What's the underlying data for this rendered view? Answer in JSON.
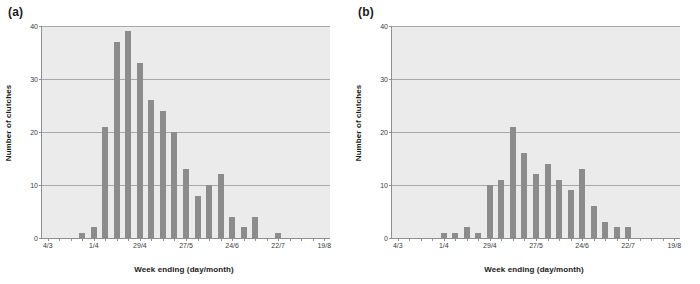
{
  "figure": {
    "background": "#ffffff",
    "bar_color": "#8c8c8c",
    "plot_background": "#ebebeb",
    "grid_color": "#a8a8a8"
  },
  "panels": [
    {
      "label": "(a)",
      "chart_data": {
        "type": "bar",
        "title": "",
        "xlabel": "Week ending (day/month)",
        "ylabel": "Number of clutches",
        "ylim": [
          0,
          40
        ],
        "yticks": [
          0,
          10,
          20,
          30,
          40
        ],
        "grid": true,
        "legend": "none",
        "x_tick_labels": [
          "4/3",
          "1/4",
          "29/4",
          "27/5",
          "24/6",
          "22/7",
          "19/8"
        ],
        "x_tick_indices": [
          0,
          4,
          8,
          12,
          16,
          20,
          24
        ],
        "n_weeks": 25,
        "categories": [
          "4/3",
          "11/3",
          "18/3",
          "25/3",
          "1/4",
          "8/4",
          "15/4",
          "22/4",
          "29/4",
          "6/5",
          "13/5",
          "20/5",
          "27/5",
          "3/6",
          "10/6",
          "17/6",
          "24/6",
          "1/7",
          "8/7",
          "15/7",
          "22/7",
          "29/7",
          "5/8",
          "12/8",
          "19/8"
        ],
        "values": [
          0,
          0,
          0,
          1,
          2,
          21,
          37,
          39,
          33,
          26,
          24,
          20,
          13,
          8,
          10,
          12,
          4,
          2,
          4,
          0,
          1,
          0,
          0,
          0,
          0
        ]
      }
    },
    {
      "label": "(b)",
      "chart_data": {
        "type": "bar",
        "title": "",
        "xlabel": "Week ending (day/month)",
        "ylabel": "Number of clutches",
        "ylim": [
          0,
          40
        ],
        "yticks": [
          0,
          10,
          20,
          30,
          40
        ],
        "grid": true,
        "legend": "none",
        "x_tick_labels": [
          "4/3",
          "1/4",
          "29/4",
          "27/5",
          "24/6",
          "22/7",
          "19/8"
        ],
        "x_tick_indices": [
          0,
          4,
          8,
          12,
          16,
          20,
          24
        ],
        "n_weeks": 25,
        "categories": [
          "4/3",
          "11/3",
          "18/3",
          "25/3",
          "1/4",
          "8/4",
          "15/4",
          "22/4",
          "29/4",
          "6/5",
          "13/5",
          "20/5",
          "27/5",
          "3/6",
          "10/6",
          "17/6",
          "24/6",
          "1/7",
          "8/7",
          "15/7",
          "22/7",
          "29/7",
          "5/8",
          "12/8",
          "19/8"
        ],
        "values": [
          0,
          0,
          0,
          0,
          1,
          1,
          2,
          1,
          10,
          11,
          21,
          16,
          12,
          14,
          11,
          9,
          13,
          6,
          3,
          2,
          2,
          0,
          0,
          0,
          0
        ]
      }
    }
  ]
}
